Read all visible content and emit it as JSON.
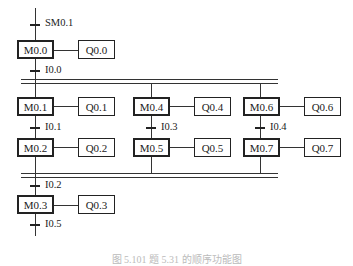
{
  "diagram": {
    "type": "sequential-function-chart",
    "initial_transition": "SM0.1",
    "initial_step": {
      "step": "M0.0",
      "action": "Q0.0"
    },
    "transition_after_initial": "I0.0",
    "branches": [
      {
        "steps": [
          {
            "step": "M0.1",
            "action": "Q0.1"
          },
          {
            "step": "M0.2",
            "action": "Q0.2"
          }
        ],
        "transition": "I0.1"
      },
      {
        "steps": [
          {
            "step": "M0.4",
            "action": "Q0.4"
          },
          {
            "step": "M0.5",
            "action": "Q0.5"
          }
        ],
        "transition": "I0.3"
      },
      {
        "steps": [
          {
            "step": "M0.6",
            "action": "Q0.6"
          },
          {
            "step": "M0.7",
            "action": "Q0.7"
          }
        ],
        "transition": "I0.4"
      }
    ],
    "transition_after_merge": "I0.2",
    "final_step": {
      "step": "M0.3",
      "action": "Q0.3"
    },
    "final_transition": "I0.5",
    "caption": "图 5.101   题 5.31 的顺序功能图"
  }
}
